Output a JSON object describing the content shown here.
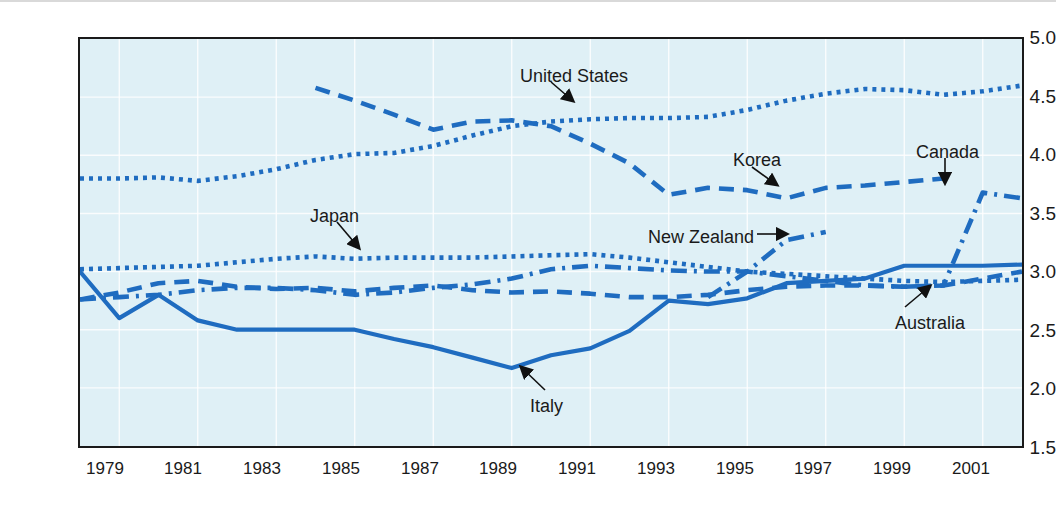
{
  "chart_data": {
    "type": "line",
    "title": "",
    "subtitle": "",
    "xlabel": "",
    "ylabel": "",
    "xlim": [
      1978,
      2002
    ],
    "ylim": [
      1.5,
      5.0
    ],
    "grid": true,
    "legend_position": "inline-annotations",
    "accent_color": "#1f6cc0",
    "plot_background": "#dff0f6",
    "xticks": [
      "1979",
      "1981",
      "1983",
      "1985",
      "1987",
      "1989",
      "1991",
      "1993",
      "1995",
      "1997",
      "1999",
      "2001"
    ],
    "xtick_values": [
      1979,
      1981,
      1983,
      1985,
      1987,
      1989,
      1991,
      1993,
      1995,
      1997,
      1999,
      2001
    ],
    "yticks": [
      "5.0",
      "4.5",
      "4.0",
      "3.5",
      "3.0",
      "2.5",
      "2.0",
      "1.5"
    ],
    "ytick_values": [
      5.0,
      4.5,
      4.0,
      3.5,
      3.0,
      2.5,
      2.0,
      1.5
    ],
    "series": [
      {
        "name": "United States",
        "style": "dotted",
        "x": [
          1978,
          1979,
          1980,
          1981,
          1982,
          1983,
          1984,
          1985,
          1986,
          1987,
          1988,
          1989,
          1990,
          1991,
          1992,
          1993,
          1994,
          1995,
          1996,
          1997,
          1998,
          1999,
          2000,
          2001,
          2002
        ],
        "values": [
          3.8,
          3.8,
          3.81,
          3.78,
          3.82,
          3.88,
          3.96,
          4.01,
          4.02,
          4.08,
          4.17,
          4.25,
          4.29,
          4.31,
          4.32,
          4.32,
          4.33,
          4.39,
          4.47,
          4.53,
          4.57,
          4.56,
          4.52,
          4.55,
          4.6
        ]
      },
      {
        "name": "Korea",
        "style": "dashed",
        "x": [
          1984,
          1985,
          1986,
          1987,
          1988,
          1989,
          1990,
          1991,
          1992,
          1993,
          1994,
          1995,
          1996,
          1997,
          1998,
          1999,
          2000
        ],
        "values": [
          4.58,
          4.47,
          4.35,
          4.22,
          4.29,
          4.3,
          4.25,
          4.1,
          3.93,
          3.66,
          3.72,
          3.7,
          3.63,
          3.72,
          3.74,
          3.77,
          3.8
        ]
      },
      {
        "name": "Canada",
        "style": "dash-dot",
        "x": [
          1978,
          1979,
          1980,
          1981,
          1982,
          1983,
          1984,
          1985,
          1986,
          1987,
          1988,
          1989,
          1990,
          1991,
          1992,
          1993,
          1994,
          1995,
          1996,
          1997,
          1998,
          1999,
          2000,
          2001,
          2002
        ],
        "values": [
          2.76,
          2.78,
          2.8,
          2.84,
          2.86,
          2.86,
          2.84,
          2.8,
          2.82,
          2.86,
          2.89,
          2.94,
          3.02,
          3.05,
          3.03,
          3.01,
          3.0,
          3.0,
          2.96,
          2.92,
          2.88,
          2.87,
          2.88,
          3.68,
          3.63
        ]
      },
      {
        "name": "Japan",
        "style": "dotted",
        "x": [
          1978,
          1979,
          1980,
          1981,
          1982,
          1983,
          1984,
          1985,
          1986,
          1987,
          1988,
          1989,
          1990,
          1991,
          1992,
          1993,
          1994,
          1995,
          1996,
          1997,
          1998,
          1999,
          2000,
          2001,
          2002
        ],
        "values": [
          3.02,
          3.03,
          3.04,
          3.05,
          3.08,
          3.11,
          3.13,
          3.11,
          3.12,
          3.12,
          3.12,
          3.13,
          3.14,
          3.15,
          3.12,
          3.08,
          3.04,
          3.0,
          2.98,
          2.96,
          2.94,
          2.92,
          2.91,
          2.92,
          2.93
        ]
      },
      {
        "name": "New Zealand",
        "style": "dash-dot",
        "x": [
          1994,
          1995,
          1996,
          1997
        ],
        "values": [
          2.78,
          3.0,
          3.27,
          3.34
        ]
      },
      {
        "name": "Australia",
        "style": "dashed",
        "x": [
          1978,
          1979,
          1980,
          1981,
          1982,
          1983,
          1984,
          1985,
          1986,
          1987,
          1988,
          1989,
          1990,
          1991,
          1992,
          1993,
          1994,
          1995,
          1996,
          1997,
          1998,
          1999,
          2000,
          2001,
          2002
        ],
        "values": [
          2.76,
          2.82,
          2.9,
          2.92,
          2.87,
          2.85,
          2.86,
          2.83,
          2.86,
          2.88,
          2.84,
          2.82,
          2.83,
          2.81,
          2.78,
          2.78,
          2.8,
          2.84,
          2.87,
          2.88,
          2.88,
          2.87,
          2.88,
          2.94,
          3.0
        ]
      },
      {
        "name": "Italy",
        "style": "solid",
        "x": [
          1978,
          1979,
          1980,
          1981,
          1982,
          1983,
          1984,
          1985,
          1986,
          1987,
          1988,
          1989,
          1990,
          1991,
          1992,
          1993,
          1994,
          1995,
          1996,
          1997,
          1998,
          1999,
          2000,
          2001,
          2002
        ],
        "values": [
          3.0,
          2.6,
          2.8,
          2.58,
          2.5,
          2.5,
          2.5,
          2.5,
          2.42,
          2.35,
          2.26,
          2.17,
          2.28,
          2.34,
          2.49,
          2.75,
          2.72,
          2.77,
          2.9,
          2.92,
          2.94,
          3.05,
          3.05,
          3.05,
          3.06
        ]
      }
    ],
    "annotations": [
      {
        "label": "United States",
        "target_series": "United States"
      },
      {
        "label": "Korea",
        "target_series": "Korea"
      },
      {
        "label": "Canada",
        "target_series": "Canada"
      },
      {
        "label": "Japan",
        "target_series": "Japan"
      },
      {
        "label": "New Zealand",
        "target_series": "New Zealand"
      },
      {
        "label": "Australia",
        "target_series": "Australia"
      },
      {
        "label": "Italy",
        "target_series": "Italy"
      }
    ]
  },
  "axis": {
    "y_labels": [
      "5.0",
      "4.5",
      "4.0",
      "3.5",
      "3.0",
      "2.5",
      "2.0",
      "1.5"
    ],
    "x_labels": [
      "1979",
      "1981",
      "1983",
      "1985",
      "1987",
      "1989",
      "1991",
      "1993",
      "1995",
      "1997",
      "1999",
      "2001"
    ]
  },
  "labels": {
    "united_states": "United States",
    "korea": "Korea",
    "canada": "Canada",
    "japan": "Japan",
    "new_zealand": "New Zealand",
    "australia": "Australia",
    "italy": "Italy"
  }
}
